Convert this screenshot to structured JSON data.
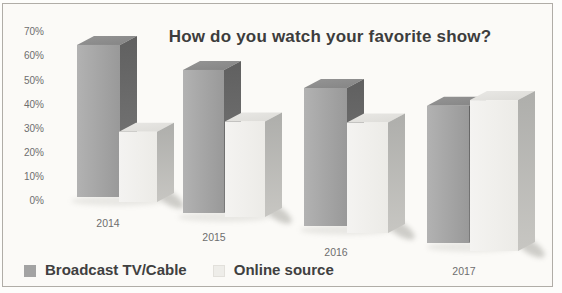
{
  "chart_data": {
    "type": "bar",
    "variant": "3d-clustered-column",
    "title": "How do you watch your favorite show?",
    "categories": [
      "2014",
      "2015",
      "2016",
      "2017"
    ],
    "series": [
      {
        "name": "Broadcast TV/Cable",
        "color": "#a3a3a3",
        "values": [
          65,
          57,
          50,
          40
        ]
      },
      {
        "name": "Online source",
        "color": "#f1f0ed",
        "values": [
          30,
          38,
          40,
          44
        ]
      }
    ],
    "values_unit": "%",
    "xlabel": "",
    "ylabel": "",
    "ylim": [
      0,
      70
    ],
    "ytick_step": 10,
    "yticks": [
      "0%",
      "10%",
      "20%",
      "30%",
      "40%",
      "50%",
      "60%",
      "70%"
    ],
    "grid": false,
    "legend_position": "bottom-left"
  },
  "colors": {
    "frame_border": "#b0ada7",
    "frame_background": "#fbfaf7",
    "title_text": "#3d3d3d",
    "axis_text": "#6e6e6e",
    "legend_text": "#404040"
  }
}
